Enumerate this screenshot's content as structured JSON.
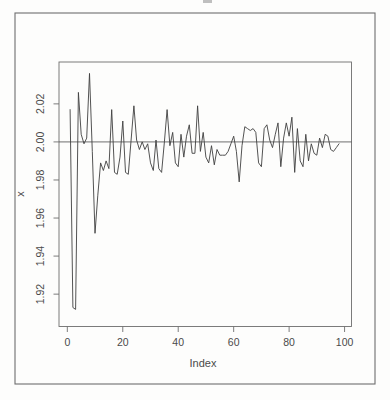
{
  "figure": {
    "background_color": "#fdfdfc",
    "frame_color": "#6e6e6e",
    "line_color": "#3f3f3f",
    "text_color": "#4a4a4a"
  },
  "chart_data": {
    "type": "line",
    "title": "",
    "xlabel": "Index",
    "ylabel": "x",
    "legend": "none",
    "grid": false,
    "xlim": [
      -3,
      102.5
    ],
    "ylim": [
      1.903,
      2.042
    ],
    "x_ticks": [
      0,
      20,
      40,
      60,
      80,
      100
    ],
    "x_tick_labels": [
      "0",
      "20",
      "40",
      "60",
      "80",
      "100"
    ],
    "y_ticks": [
      1.92,
      1.94,
      1.96,
      1.98,
      2.0,
      2.02
    ],
    "y_tick_labels": [
      "1.92",
      "1.94",
      "1.96",
      "1.98",
      "2.00",
      "2.02"
    ],
    "reference_line_y": 2.0,
    "x": [
      1,
      2,
      3,
      4,
      5,
      6,
      7,
      8,
      9,
      10,
      11,
      12,
      13,
      14,
      15,
      16,
      17,
      18,
      19,
      20,
      21,
      22,
      23,
      24,
      25,
      26,
      27,
      28,
      29,
      30,
      31,
      32,
      33,
      34,
      35,
      36,
      37,
      38,
      39,
      40,
      41,
      42,
      43,
      44,
      45,
      46,
      47,
      48,
      49,
      50,
      51,
      52,
      53,
      54,
      55,
      56,
      57,
      58,
      59,
      60,
      61,
      62,
      63,
      64,
      65,
      66,
      67,
      68,
      69,
      70,
      71,
      72,
      73,
      74,
      75,
      76,
      77,
      78,
      79,
      80,
      81,
      82,
      83,
      84,
      85,
      86,
      87,
      88,
      89,
      90,
      91,
      92,
      93,
      94,
      95,
      96,
      97,
      98
    ],
    "values": [
      2.017,
      1.913,
      1.912,
      2.026,
      2.004,
      1.999,
      2.002,
      2.036,
      1.995,
      1.952,
      1.972,
      1.989,
      1.985,
      1.99,
      1.986,
      2.017,
      1.984,
      1.983,
      1.992,
      2.011,
      1.984,
      1.983,
      2.001,
      2.019,
      2.001,
      1.996,
      2.0,
      1.996,
      1.999,
      1.989,
      1.985,
      2.001,
      1.986,
      1.984,
      2.0,
      2.017,
      1.998,
      2.005,
      1.989,
      1.987,
      2.004,
      1.992,
      2.003,
      2.009,
      1.994,
      1.994,
      2.019,
      1.995,
      2.005,
      1.992,
      1.989,
      1.998,
      1.988,
      1.996,
      1.993,
      1.993,
      1.993,
      1.995,
      1.999,
      2.003,
      1.995,
      1.979,
      1.998,
      2.008,
      2.007,
      2.006,
      2.007,
      2.005,
      1.989,
      1.987,
      2.007,
      2.009,
      2.001,
      1.997,
      2.004,
      2.01,
      1.987,
      2.002,
      2.01,
      2.003,
      2.013,
      1.984,
      2.007,
      1.99,
      1.987,
      2.004,
      1.99,
      1.999,
      1.994,
      1.993,
      2.002,
      1.997,
      2.004,
      2.003,
      1.996,
      1.995,
      1.997,
      1.999
    ]
  }
}
